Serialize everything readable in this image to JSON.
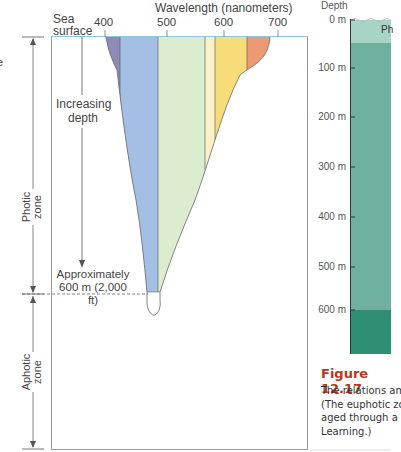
{
  "diagram": {
    "title": "Wavelength (nanometers)",
    "axis_ticks": [
      "400",
      "500",
      "600",
      "700"
    ],
    "sea_surface_label": [
      "Sea",
      "surface"
    ],
    "increasing_depth_label": [
      "Increasing",
      "depth"
    ],
    "approx_depth_label": [
      "Approximately",
      "600 m (2,000 ft)"
    ],
    "photic_zone_label": [
      "Photic",
      "zone"
    ],
    "aphotic_zone_label": [
      "Aphotic",
      "zone"
    ],
    "left_cut_glyph": "e",
    "bands": [
      {
        "name": "violet",
        "color": "#8e8bb5"
      },
      {
        "name": "blue",
        "color": "#a3bfe3"
      },
      {
        "name": "green",
        "color": "#dcecce"
      },
      {
        "name": "pale-yellow",
        "color": "#fbf1c8"
      },
      {
        "name": "yellow",
        "color": "#f8dc7a"
      },
      {
        "name": "orange",
        "color": "#eb9a73"
      }
    ],
    "surface_line_color": "#8cc9dd"
  },
  "right_panel": {
    "depth_header": "Depth",
    "depth_ticks": [
      "0 m",
      "100 m",
      "200 m",
      "300 m",
      "400 m",
      "500 m",
      "600 m"
    ],
    "zone_label_partial": "Ph",
    "colors": {
      "top": "#a8d4c7",
      "mid": "#6fb0a0",
      "deep": "#2f8f74"
    }
  },
  "caption": {
    "figure_number": "Figure 12.17",
    "lines": [
      "The relations am",
      "(The euphotic zo",
      "aged through a s",
      "Learning.)"
    ]
  }
}
